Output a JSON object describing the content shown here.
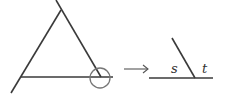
{
  "diagram": {
    "labels": {
      "s": "s",
      "t": "t"
    },
    "colors": {
      "line": "#3a3a3a",
      "circle": "#777777",
      "arrow": "#555555"
    }
  }
}
